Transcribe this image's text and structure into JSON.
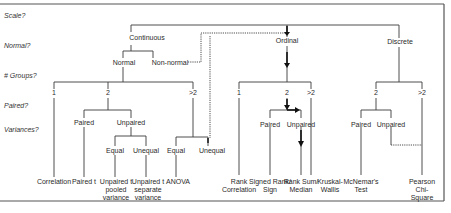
{
  "questions": {
    "scale": "Scale?",
    "normal": "Normal?",
    "groups": "# Groups?",
    "paired": "Paired?",
    "variances": "Variances?"
  },
  "scale_types": {
    "continuous": "Continuous",
    "ordinal": "Ordinal",
    "discrete": "Discrete"
  },
  "continuous": {
    "normal": "Normal",
    "non_normal": "Non-normal",
    "groups": {
      "one": "1",
      "two": "2",
      "more": ">2"
    },
    "two": {
      "paired": "Paired",
      "unpaired": "Unpaired",
      "equal": "Equal",
      "unequal": "Unequal"
    },
    "more": {
      "equal": "Equal",
      "unequal": "Unequal"
    },
    "tests": {
      "correlation": "Correlation",
      "paired_t": "Paired t",
      "unpaired_pooled": "Unpaired t\npooled\nvariance",
      "unpaired_separate": "Unpaired t\nseparate\nvariance",
      "anova": "ANOVA"
    }
  },
  "ordinal": {
    "groups": {
      "one": "1",
      "two": "2",
      "more": ">2"
    },
    "two": {
      "paired": "Paired",
      "unpaired": "Unpaired"
    },
    "tests": {
      "rank_correlation": "Rank\nCorrelation",
      "signed_rank": "Signed Rank/\nSign",
      "rank_sum": "Rank Sum/\nMedian",
      "kruskal": "Kruskal-\nWallis"
    }
  },
  "discrete": {
    "groups": {
      "two": "2",
      "more": ">2"
    },
    "two": {
      "paired": "Paired",
      "unpaired": "Unpaired"
    },
    "tests": {
      "mcnemar": "McNemar's\nTest",
      "chi_square": "Pearson\nChi-Square"
    }
  },
  "colors": {
    "line": "#3a3a3a",
    "frame": "#555555",
    "text": "#2a2a2a"
  }
}
